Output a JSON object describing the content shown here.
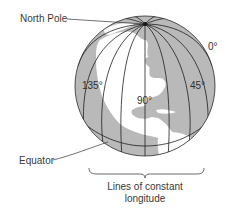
{
  "diagram": {
    "labels": {
      "north_pole": "North Pole",
      "equator": "Equator"
    },
    "longitudes": {
      "zero": "0°",
      "forty_five": "45°",
      "ninety": "90°",
      "one_thirty_five": "135°"
    },
    "caption": {
      "line1": "Lines of constant",
      "line2": "longitude"
    },
    "colors": {
      "ocean": "#b9b9b9",
      "land": "#ffffff",
      "lines": "#1e1e1e",
      "text": "#3a3a3a"
    }
  }
}
